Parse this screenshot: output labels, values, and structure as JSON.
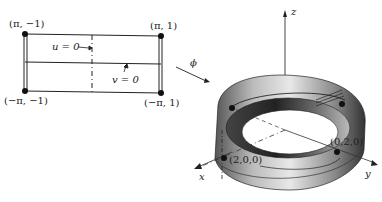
{
  "domain_region": {
    "rectangle": {
      "corners": [
        {
          "id": "top-left",
          "label": "(π, −1)"
        },
        {
          "id": "top-right",
          "label": "(π, 1)"
        },
        {
          "id": "bottom-left",
          "label": "(−π, −1)"
        },
        {
          "id": "bottom-right",
          "label": "(−π, 1)"
        }
      ],
      "lines": [
        {
          "id": "u-line",
          "label": "u = 0"
        },
        {
          "id": "v-line",
          "label": "v = 0"
        }
      ]
    }
  },
  "mapping": {
    "label": "ϕ"
  },
  "surface": {
    "axes": {
      "x": "x",
      "y": "y",
      "z": "z"
    },
    "points": [
      {
        "id": "p-x",
        "label": "(2,0,0)"
      },
      {
        "id": "p-y",
        "label": "(0,2,0)"
      }
    ]
  },
  "colors": {
    "ink": "#222222",
    "band_dark": "#3a3a3a",
    "band_light": "#d8d8d8"
  }
}
